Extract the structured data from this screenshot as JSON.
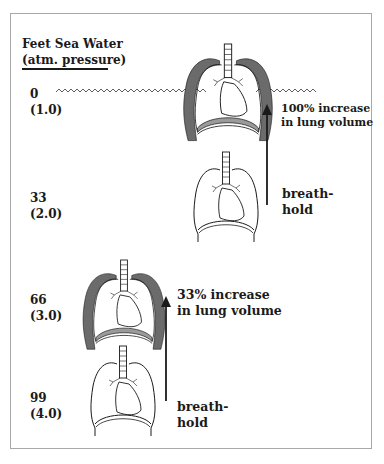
{
  "header": {
    "line1": "Feet Sea Water",
    "line2": "(atm. pressure)"
  },
  "depths": [
    {
      "feet": "0",
      "atm": "(1.0)"
    },
    {
      "feet": "33",
      "atm": "(2.0)"
    },
    {
      "feet": "66",
      "atm": "(3.0)"
    },
    {
      "feet": "99",
      "atm": "(4.0)"
    }
  ],
  "annotations": {
    "upper_increase": {
      "line1": "100% increase",
      "line2": "in lung volume"
    },
    "upper_breathhold": {
      "line1": "breath-",
      "line2": "hold"
    },
    "lower_increase": {
      "line1": "33% increase",
      "line2": "in lung volume"
    },
    "lower_breathhold": {
      "line1": "breath-",
      "line2": "hold"
    }
  },
  "figures": [
    {
      "name": "lungs-surface-expanded",
      "depth": "0",
      "state": "expanded"
    },
    {
      "name": "lungs-33ft",
      "depth": "33",
      "state": "normal"
    },
    {
      "name": "lungs-66ft-expanded",
      "depth": "66",
      "state": "expanded"
    },
    {
      "name": "lungs-99ft",
      "depth": "99",
      "state": "normal"
    }
  ],
  "colors": {
    "ink": "#1a1a1a",
    "shading": "#6b6b6b",
    "frame": "#a8a8a8"
  }
}
